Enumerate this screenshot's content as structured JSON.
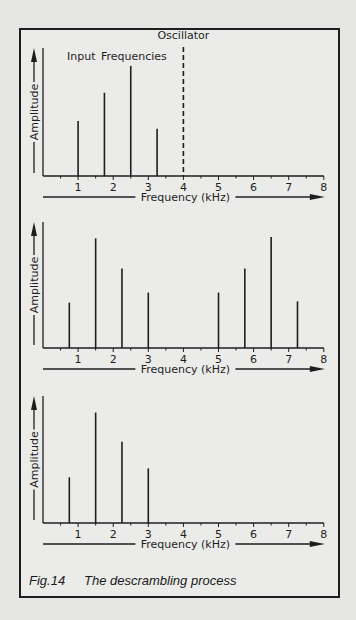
{
  "figure": {
    "caption_label": "Fig.14",
    "caption_text": "The descrambling process"
  },
  "chart_data": [
    {
      "type": "bar",
      "title": "Input Frequencies",
      "annotation": "Oscillator",
      "annotation_x": 4,
      "annotation_style": "dashed vertical line",
      "xlabel": "Frequency (kHz)",
      "ylabel": "Amplitude",
      "xlim": [
        0,
        8
      ],
      "xticks": [
        1,
        2,
        3,
        4,
        5,
        6,
        7,
        8
      ],
      "ylim": [
        0,
        1
      ],
      "grid": false,
      "x": [
        1.0,
        1.75,
        2.5,
        3.25
      ],
      "values": [
        0.43,
        0.65,
        0.86,
        0.37
      ]
    },
    {
      "type": "bar",
      "xlabel": "Frequency (kHz)",
      "ylabel": "Amplitude",
      "xlim": [
        0,
        8
      ],
      "xticks": [
        1,
        2,
        3,
        4,
        5,
        6,
        7,
        8
      ],
      "ylim": [
        0,
        1
      ],
      "grid": false,
      "x": [
        0.75,
        1.5,
        2.25,
        3.0,
        5.0,
        5.75,
        6.5,
        7.25
      ],
      "values": [
        0.36,
        0.87,
        0.63,
        0.44,
        0.44,
        0.63,
        0.88,
        0.37
      ]
    },
    {
      "type": "bar",
      "xlabel": "Frequency (kHz)",
      "ylabel": "Amplitude",
      "xlim": [
        0,
        8
      ],
      "xticks": [
        1,
        2,
        3,
        4,
        5,
        6,
        7,
        8
      ],
      "ylim": [
        0,
        1
      ],
      "grid": false,
      "x": [
        0.75,
        1.5,
        2.25,
        3.0
      ],
      "values": [
        0.36,
        0.87,
        0.64,
        0.43
      ]
    }
  ],
  "layout": {
    "panels": [
      {
        "baseline": 176,
        "top": 48
      },
      {
        "baseline": 348,
        "top": 222
      },
      {
        "baseline": 523,
        "top": 396
      }
    ],
    "x0": 43,
    "px_per_khz": 35.1
  },
  "colors": {
    "ink": "#1e1e1e",
    "background": "#e6e6e4",
    "panel": "#ebebe9"
  }
}
